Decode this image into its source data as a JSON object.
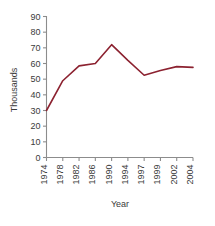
{
  "chart_data": {
    "type": "line",
    "title": "",
    "subtitle": "",
    "xlabel": "Year",
    "ylabel": "Thousands",
    "categories": [
      "1974",
      "1978",
      "1982",
      "1986",
      "1990",
      "1994",
      "1997",
      "1999",
      "2002",
      "2004"
    ],
    "x": [
      1974,
      1978,
      1982,
      1986,
      1990,
      1994,
      1997,
      1999,
      2002,
      2004
    ],
    "values": [
      30,
      49,
      58.5,
      60,
      72,
      62,
      52.5,
      55.5,
      58,
      57.5
    ],
    "series": [
      {
        "name": "",
        "values": [
          30,
          49,
          58.5,
          60,
          72,
          62,
          52.5,
          55.5,
          58,
          57.5
        ],
        "color": "#8c2230"
      }
    ],
    "ylim": [
      0,
      90
    ],
    "ytick_values": [
      0,
      10,
      20,
      30,
      40,
      50,
      60,
      70,
      80,
      90
    ],
    "ytick_labels": [
      "0",
      "10",
      "20",
      "30",
      "40",
      "50",
      "60",
      "70",
      "80",
      "90"
    ],
    "grid": false,
    "legend": false,
    "legend_position": "none",
    "axis_color": "#8c8c8c",
    "text_color": "#3b3b3b",
    "background": "#ffffff"
  },
  "axes": {
    "y_title": "Thousands",
    "x_title": "Year"
  }
}
